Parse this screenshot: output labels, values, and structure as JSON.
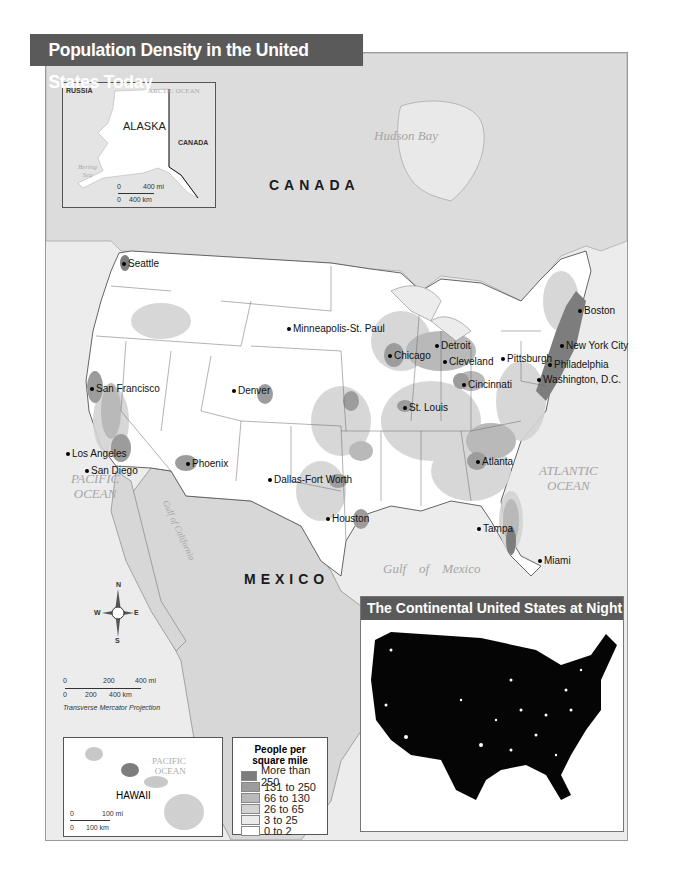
{
  "title": "Population Density in the United States Today",
  "labels": {
    "canada": "CANADA",
    "mexico": "MEXICO",
    "hudson_bay": "Hudson Bay",
    "pacific_ocean": "PACIFIC\nOCEAN",
    "atlantic_ocean": "ATLANTIC\nOCEAN",
    "gulf_of_mexico": "Gulf    of    Mexico",
    "gulf_of_california": "Gulf of California"
  },
  "cities": [
    {
      "name": "Seattle",
      "x": 122,
      "y": 258
    },
    {
      "name": "Minneapolis-St. Paul",
      "x": 287,
      "y": 323
    },
    {
      "name": "San Francisco",
      "x": 90,
      "y": 383
    },
    {
      "name": "Denver",
      "x": 232,
      "y": 385
    },
    {
      "name": "Los Angeles",
      "x": 66,
      "y": 448
    },
    {
      "name": "San Diego",
      "x": 85,
      "y": 465
    },
    {
      "name": "Phoenix",
      "x": 186,
      "y": 458
    },
    {
      "name": "Dallas-Fort Worth",
      "x": 268,
      "y": 474
    },
    {
      "name": "Houston",
      "x": 326,
      "y": 513
    },
    {
      "name": "Chicago",
      "x": 388,
      "y": 350
    },
    {
      "name": "Detroit",
      "x": 435,
      "y": 340
    },
    {
      "name": "Cleveland",
      "x": 443,
      "y": 356
    },
    {
      "name": "Pittsburgh",
      "x": 501,
      "y": 353
    },
    {
      "name": "Cincinnati",
      "x": 462,
      "y": 379
    },
    {
      "name": "St. Louis",
      "x": 403,
      "y": 402
    },
    {
      "name": "Boston",
      "x": 578,
      "y": 305
    },
    {
      "name": "New York City",
      "x": 560,
      "y": 340
    },
    {
      "name": "Philadelphia",
      "x": 548,
      "y": 359
    },
    {
      "name": "Washington, D.C.",
      "x": 537,
      "y": 374
    },
    {
      "name": "Atlanta",
      "x": 476,
      "y": 456
    },
    {
      "name": "Tampa",
      "x": 477,
      "y": 523
    },
    {
      "name": "Miami",
      "x": 538,
      "y": 555
    }
  ],
  "alaska_inset": {
    "title": "ALASKA",
    "russia": "RUSSIA",
    "canada": "CANADA",
    "arctic_ocean": "ARCTIC OCEAN",
    "bering_sea": "Bering\nSea",
    "scale_mi": "400 mi",
    "scale_km": "400 km",
    "zero": "0"
  },
  "hawaii_inset": {
    "title": "HAWAII",
    "pacific_ocean": "PACIFIC\nOCEAN",
    "scale_mi": "100 mi",
    "scale_km": "100 km",
    "zero": "0"
  },
  "main_scale": {
    "mi_ticks": [
      "0",
      "200",
      "400 mi"
    ],
    "km_ticks": [
      "0",
      "200",
      "400 km"
    ],
    "projection": "Transverse Mercator Projection"
  },
  "compass": {
    "n": "N",
    "s": "S",
    "e": "E",
    "w": "W"
  },
  "legend": {
    "title": "People per\nsquare mile",
    "items": [
      {
        "label": "More than 250",
        "color": "#7d7d7d"
      },
      {
        "label": "131 to 250",
        "color": "#9c9c9c"
      },
      {
        "label": "66 to 130",
        "color": "#b9b9b9"
      },
      {
        "label": "26 to 65",
        "color": "#d3d3d3"
      },
      {
        "label": "3 to 25",
        "color": "#ebebeb"
      },
      {
        "label": "0 to 2",
        "color": "#ffffff"
      }
    ]
  },
  "night_panel": {
    "title": "The Continental United States at Night"
  },
  "colors": {
    "title_bar": "#5a5a5a",
    "land_other": "#d9d9d9",
    "water": "#ececec"
  }
}
